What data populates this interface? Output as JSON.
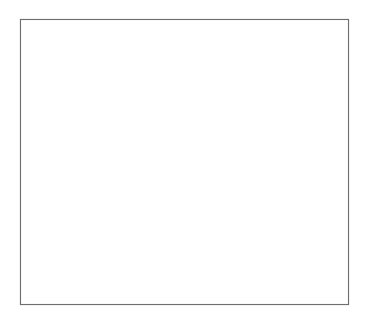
{
  "figure": {
    "alt_text": "Outline map showing state and national boundaries with two levels of gray shading indicating a species range along the Sierra Madre Occidental and Sierra Madre Oriental",
    "width_px": 367,
    "height_px": 321,
    "background_color": "#ffffff"
  },
  "frame": {
    "x": 20,
    "y": 19,
    "width": 329,
    "height": 286,
    "stroke_color": "#6e6e6e",
    "fill_color": "#ffffff"
  },
  "legend": {
    "visible": false,
    "entries": [
      {
        "label": "Peripheral range",
        "color": "#c8c8c8"
      },
      {
        "label": "Core range",
        "color": "#ababab"
      }
    ]
  },
  "layers": [
    {
      "name": "range-peripheral",
      "label": "Peripheral range",
      "color": "#c8c8c8",
      "description": "Broad light gray band extending from southeastern Arizona and southwestern New Mexico southeast through Sonora, Chihuahua and Durango, plus an eastern lobe through Coahuila and Nuevo Leon"
    },
    {
      "name": "range-core",
      "label": "Core range",
      "color": "#ababab",
      "description": "Darker gray band along the Sierra Madre Occidental western flank and along the Sierra Madre Oriental eastern lobe"
    },
    {
      "name": "state-borders",
      "label": "State and province boundaries",
      "color": "#777777"
    },
    {
      "name": "international-border",
      "label": "United States - Mexico border",
      "color": "#4a4a4a"
    },
    {
      "name": "coastline",
      "label": "Coastline",
      "color": "#808080"
    }
  ],
  "regions": {
    "united_states": [
      "California",
      "Nevada",
      "Utah",
      "Colorado",
      "Arizona",
      "New Mexico",
      "Texas",
      "Oklahoma",
      "Kansas",
      "Arkansas",
      "Louisiana"
    ],
    "mexico": [
      "Baja California",
      "Baja California Sur",
      "Sonora",
      "Chihuahua",
      "Coahuila",
      "Nuevo Leon",
      "Sinaloa",
      "Durango"
    ],
    "water_bodies": [
      "Gulf of California",
      "Pacific Ocean",
      "Gulf of Mexico"
    ]
  }
}
